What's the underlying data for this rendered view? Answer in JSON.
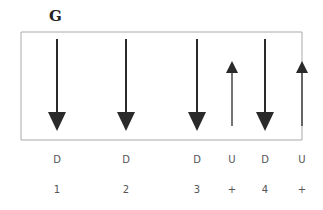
{
  "title": "G",
  "box": {
    "left": 21,
    "top": 32,
    "right": 302,
    "bottom": 140,
    "color": "#aaaaaa"
  },
  "arrows": [
    {
      "x": 57,
      "direction": "down",
      "label": "D",
      "number": "1"
    },
    {
      "x": 126,
      "direction": "down",
      "label": "D",
      "number": "2"
    },
    {
      "x": 197,
      "direction": "down",
      "label": "D",
      "number": "3"
    },
    {
      "x": 232,
      "direction": "up",
      "label": "U",
      "number": "+"
    },
    {
      "x": 265,
      "direction": "down",
      "label": "D",
      "number": "4"
    },
    {
      "x": 302,
      "direction": "up",
      "label": "U",
      "number": "+"
    }
  ],
  "colors": {
    "arrow": "#2a2a2a",
    "text": "#555555"
  }
}
